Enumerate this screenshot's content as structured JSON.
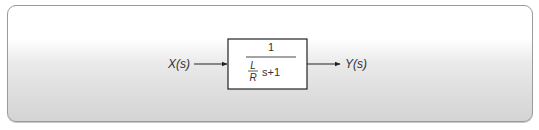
{
  "diagram": {
    "input_label": "X(s)",
    "output_label": "Y(s)",
    "block": {
      "numerator": "1",
      "denominator": {
        "fraction_num": "L",
        "fraction_den": "R",
        "tail": "s+1"
      }
    },
    "colors": {
      "line": "#222222",
      "text": "#333333",
      "panel_border": "#9a9a9a"
    }
  }
}
